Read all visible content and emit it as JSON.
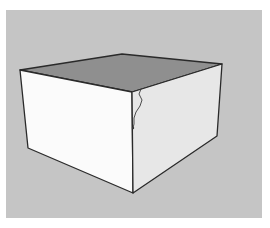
{
  "viewport": {
    "background_color": "#c5c5c5",
    "frame_color": "#ffffff"
  },
  "model": {
    "type": "box",
    "faces": {
      "top": {
        "color": "#8f8f8f"
      },
      "left": {
        "color": "#fbfbfb"
      },
      "right": {
        "color": "#e7e7e7"
      }
    },
    "edge_color": "#2a2a2a",
    "vertices": {
      "back_top": [
        122,
        54
      ],
      "left_top": [
        20,
        70
      ],
      "right_top": [
        222,
        64
      ],
      "front_top": [
        132,
        92
      ],
      "left_bottom": [
        28,
        148
      ],
      "right_bottom": [
        217,
        136
      ],
      "front_bottom": [
        133,
        193
      ]
    },
    "freehand_line": {
      "color": "#3a3a3a",
      "points": [
        [
          141,
          89
        ],
        [
          139,
          94
        ],
        [
          142,
          100
        ],
        [
          140,
          106
        ],
        [
          136,
          112
        ],
        [
          134,
          118
        ],
        [
          134,
          124
        ],
        [
          133,
          128
        ]
      ]
    }
  }
}
